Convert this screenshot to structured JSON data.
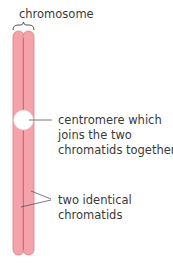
{
  "diagram": {
    "title": "chromosome",
    "labels": {
      "centromere_line1": "centromere which",
      "centromere_line2": "joins the two",
      "centromere_line3": "chromatids together",
      "chromatids_line1": "two identical",
      "chromatids_line2": "chromatids"
    },
    "colors": {
      "chromatid_fill": "#f4a3ab",
      "chromatid_stroke": "#e07b86",
      "centromere_fill": "#ffffff",
      "line": "#555555"
    }
  }
}
